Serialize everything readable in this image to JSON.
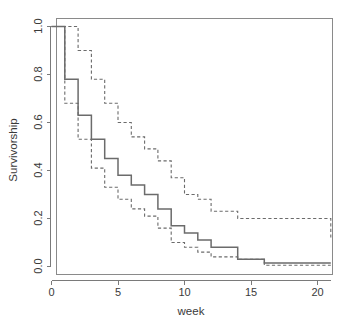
{
  "chart_data": {
    "type": "line",
    "title": "",
    "subtitle": "",
    "xlabel": "week",
    "ylabel": "Survivorship",
    "xlim": [
      -0.6,
      21.8
    ],
    "ylim": [
      -0.04,
      1.04
    ],
    "grid": false,
    "legend": null,
    "legend_position": "none",
    "step_type": "post",
    "x_ticks": [
      0,
      5,
      10,
      15,
      20
    ],
    "x_tick_labels": [
      "0",
      "5",
      "10",
      "15",
      "20"
    ],
    "y_ticks": [
      0.0,
      0.2,
      0.4,
      0.6,
      0.8,
      1.0
    ],
    "y_tick_labels": [
      "0.0",
      "0.2",
      "0.4",
      "0.6",
      "0.8",
      "1.0"
    ],
    "annotations": [],
    "series": [
      {
        "name": "survivorship-estimate",
        "style": "solid",
        "color": "#6b6b6b",
        "x": [
          0,
          1,
          2,
          3,
          4,
          5,
          6,
          7,
          8,
          9,
          10,
          11,
          12,
          14,
          16,
          21
        ],
        "values": [
          1.0,
          0.78,
          0.63,
          0.53,
          0.45,
          0.38,
          0.34,
          0.3,
          0.24,
          0.17,
          0.14,
          0.11,
          0.08,
          0.03,
          0.015,
          0.015
        ]
      },
      {
        "name": "upper-confidence-limit",
        "style": "dashed",
        "color": "#6b6b6b",
        "x": [
          0,
          1,
          2,
          3,
          4,
          5,
          6,
          7,
          8,
          9,
          10,
          11,
          12,
          14,
          21
        ],
        "values": [
          1.0,
          1.0,
          0.9,
          0.78,
          0.68,
          0.6,
          0.54,
          0.49,
          0.44,
          0.37,
          0.3,
          0.28,
          0.23,
          0.2,
          0.12
        ]
      },
      {
        "name": "lower-confidence-limit",
        "style": "dashed",
        "color": "#6b6b6b",
        "x": [
          0,
          1,
          2,
          3,
          4,
          5,
          6,
          7,
          8,
          9,
          10,
          11,
          12,
          14,
          16,
          21
        ],
        "values": [
          1.0,
          0.68,
          0.53,
          0.41,
          0.33,
          0.28,
          0.24,
          0.21,
          0.16,
          0.1,
          0.08,
          0.06,
          0.04,
          0.03,
          0.005,
          0.005
        ]
      }
    ]
  },
  "axis": {
    "xlabel": "week",
    "ylabel": "Survivorship"
  }
}
